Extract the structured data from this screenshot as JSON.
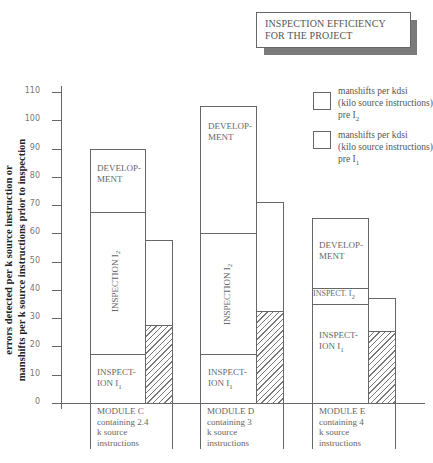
{
  "title": "INSPECTION EFFICIENCY FOR THE PROJECT",
  "title_line1": "INSPECTION EFFICIENCY",
  "title_line2": "FOR THE PROJECT",
  "y_axis": {
    "label_line1": "errors detected per k source instruction or",
    "label_line2": "manshifts per k source instructions prior to inspection",
    "ticks": [
      "0",
      "10",
      "20",
      "30",
      "40",
      "50",
      "60",
      "70",
      "80",
      "90",
      "100",
      "110"
    ]
  },
  "legend": [
    {
      "line1": "manshifts per kdsi",
      "line2": "(kilo source instructions)",
      "line3": "pre I",
      "sub": "2",
      "style": "plain"
    },
    {
      "line1": "manshifts per kdsi",
      "line2": "(kilo source instructions)",
      "line3": "pre I",
      "sub": "1",
      "style": "hatched"
    }
  ],
  "modules": [
    {
      "line1": "MODULE C",
      "line2": "containing 2.4",
      "line3": "k source",
      "line4": "instructions",
      "seg_dev": "DEVELOP-",
      "seg_dev2": "MENT",
      "seg_i2": "INSPECTION I",
      "seg_i2_sub": "2",
      "seg_i1": "INSPECT-",
      "seg_i1b": "ION I",
      "seg_i1_sub": "1"
    },
    {
      "line1": "MODULE D",
      "line2": "containing 3",
      "line3": "k source",
      "line4": "instructions",
      "seg_dev": "DEVELOP-",
      "seg_dev2": "MENT",
      "seg_i2": "INSPECTION I",
      "seg_i2_sub": "2",
      "seg_i1": "INSPECT-",
      "seg_i1b": "ION I",
      "seg_i1_sub": "1"
    },
    {
      "line1": "MODULE E",
      "line2": "containing 4",
      "line3": "k source",
      "line4": "instructions",
      "seg_dev": "DEVELOP-",
      "seg_dev2": "MENT",
      "seg_i2": "INSPECT. I",
      "seg_i2_sub": "2",
      "seg_i1": "INSPECT-",
      "seg_i1b": "ION I",
      "seg_i1_sub": "1"
    }
  ],
  "chart_data": {
    "type": "bar",
    "title": "INSPECTION EFFICIENCY FOR THE PROJECT",
    "xlabel": "",
    "ylabel": "errors detected per k source instruction or manshifts per k source instructions prior to inspection",
    "ylim": [
      0,
      110
    ],
    "yticks": [
      0,
      10,
      20,
      30,
      40,
      50,
      60,
      70,
      80,
      90,
      100,
      110
    ],
    "grid": false,
    "legend_position": "upper right",
    "categories": [
      "MODULE C containing 2.4 k source instructions",
      "MODULE D containing 3 k source instructions",
      "MODULE E containing 4 k source instructions"
    ],
    "stacked_series": [
      {
        "name": "INSPECTION I1",
        "values": [
          17.5,
          17.5,
          35
        ]
      },
      {
        "name": "INSPECTION I2",
        "values": [
          50,
          42.5,
          5.5
        ]
      },
      {
        "name": "DEVELOPMENT",
        "values": [
          22.5,
          45,
          24.5
        ]
      }
    ],
    "stacked_totals": [
      90,
      105,
      65
    ],
    "stacked_boundaries": {
      "I1_top": [
        17.5,
        17.5,
        35
      ],
      "I2_top": [
        67.5,
        60,
        40.5
      ],
      "total": [
        90,
        105,
        65
      ]
    },
    "side_series": [
      {
        "name": "manshifts per kdsi (kilo source instructions) pre I2",
        "style": "plain",
        "values": [
          57.5,
          70,
          35
        ]
      },
      {
        "name": "manshifts per kdsi (kilo source instructions) pre I1",
        "style": "hatched",
        "values": [
          27.5,
          32.5,
          25.5
        ]
      }
    ]
  }
}
